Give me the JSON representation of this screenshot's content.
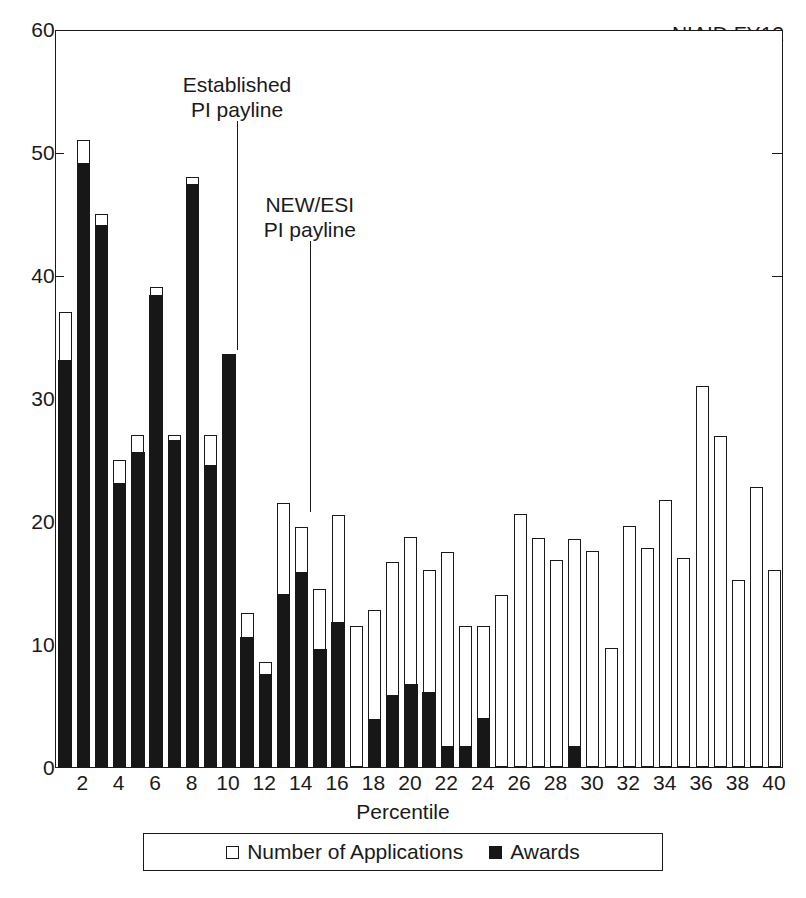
{
  "corner_title": "NIAID FY12",
  "axes": {
    "y_ticks": [
      0,
      10,
      20,
      30,
      40,
      50,
      60
    ],
    "y_tick_marks_drawn": [
      40,
      50,
      60
    ],
    "x_label": "Percentile",
    "x_ticks": [
      2,
      4,
      6,
      8,
      10,
      12,
      14,
      16,
      18,
      20,
      22,
      24,
      26,
      28,
      30,
      32,
      34,
      36,
      38,
      40
    ]
  },
  "legend": {
    "items": [
      {
        "label": "Number of Applications",
        "swatch": "open-square"
      },
      {
        "label": "Awards",
        "swatch": "filled-square"
      }
    ]
  },
  "annotations": [
    {
      "id": "established-pi-payline",
      "label": "Established\nPI payline",
      "percentile": 10.5
    },
    {
      "id": "new-esi-pi-payline",
      "label": "NEW/ESI\nPI payline",
      "percentile": 14.5
    }
  ],
  "colors": {
    "applications": "#ffffff",
    "awards": "#171717",
    "outline": "#1a1a1a",
    "background": "#ffffff"
  },
  "chart_data": {
    "type": "bar",
    "title": "NIAID FY12",
    "subtitle": "",
    "xlabel": "Percentile",
    "ylabel": "",
    "ylim": [
      0,
      60
    ],
    "grid": false,
    "legend_position": "below-axis",
    "stacked": true,
    "categories": [
      1,
      2,
      3,
      4,
      5,
      6,
      7,
      8,
      9,
      10,
      11,
      12,
      13,
      14,
      15,
      16,
      17,
      18,
      19,
      20,
      21,
      22,
      23,
      24,
      25,
      26,
      27,
      28,
      29,
      30,
      31,
      32,
      33,
      34,
      35,
      36,
      37,
      38,
      39,
      40
    ],
    "series": [
      {
        "name": "Number of Applications",
        "values": [
          37,
          51,
          45,
          25,
          27,
          39,
          27,
          48,
          27,
          33.5,
          12.5,
          8.5,
          21.5,
          19.5,
          14.5,
          20.5,
          11.5,
          12.8,
          16.7,
          18.7,
          16,
          17.5,
          11.5,
          11.5,
          14,
          20.6,
          18.6,
          16.8,
          18.5,
          17.6,
          9.7,
          19.6,
          17.8,
          21.7,
          17,
          31,
          26.9,
          15.2,
          22.8,
          16
        ]
      },
      {
        "name": "Awards",
        "values": [
          33,
          49,
          44,
          23,
          25.5,
          38.3,
          26.5,
          47.3,
          24.5,
          33.5,
          10.5,
          7.5,
          14,
          15.8,
          9.5,
          11.7,
          0,
          3.8,
          5.8,
          6.7,
          6,
          1.6,
          1.6,
          3.9,
          0,
          0,
          0,
          0,
          1.6,
          0,
          0,
          0,
          0,
          0,
          0,
          0,
          0,
          0,
          0,
          0
        ]
      }
    ]
  }
}
